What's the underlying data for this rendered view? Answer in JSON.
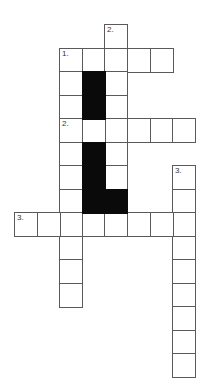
{
  "puzzle": {
    "type": "crossword",
    "cell_size": 23,
    "origin_x": 14,
    "origin_y": 24,
    "col_width": 22.6,
    "row_height": 23.5,
    "colors": {
      "cell": "#ffffff",
      "block": "#0a0a0a",
      "border": "#5a5a5a"
    },
    "clue_numbers": [
      {
        "label": "2.",
        "row": 0,
        "col": 4
      },
      {
        "label": "1.",
        "row": 1,
        "col": 2
      },
      {
        "label": "2.",
        "row": 4,
        "col": 2
      },
      {
        "label": "3.",
        "row": 6,
        "col": 7
      },
      {
        "label": "3.",
        "row": 8,
        "col": 0
      }
    ],
    "entries": [
      {
        "clue": "1.",
        "direction": "across",
        "row": 1,
        "col": 2,
        "length": 5
      },
      {
        "clue": "1.",
        "direction": "down",
        "row": 1,
        "col": 2,
        "length": 11
      },
      {
        "clue": "2.",
        "direction": "down",
        "row": 0,
        "col": 4,
        "length": 7
      },
      {
        "clue": "2.",
        "direction": "across",
        "row": 4,
        "col": 2,
        "length": 6
      },
      {
        "clue": "3.",
        "direction": "down",
        "row": 6,
        "col": 7,
        "length": 9
      },
      {
        "clue": "3.",
        "direction": "across",
        "row": 8,
        "col": 0,
        "length": 8
      }
    ],
    "blocks": [
      {
        "row": 2,
        "col": 3
      },
      {
        "row": 3,
        "col": 3
      },
      {
        "row": 5,
        "col": 3
      },
      {
        "row": 6,
        "col": 3
      },
      {
        "row": 7,
        "col": 3
      },
      {
        "row": 7,
        "col": 4
      }
    ]
  }
}
